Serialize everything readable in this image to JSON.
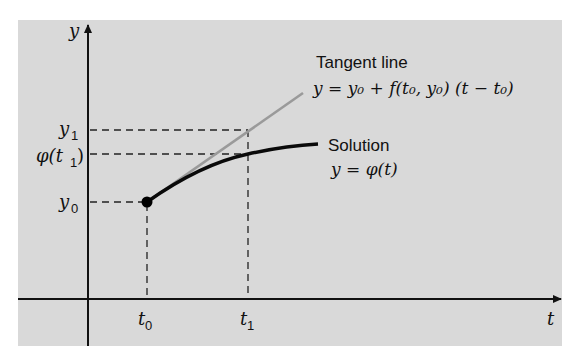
{
  "figure": {
    "type": "euler-method-diagram",
    "axes": {
      "x_label": "t",
      "y_label": "y"
    },
    "ticks": {
      "x": [
        {
          "base": "t",
          "sub": "0"
        },
        {
          "base": "t",
          "sub": "1"
        }
      ],
      "y": [
        {
          "base": "y",
          "sub": "0"
        },
        {
          "base": "y",
          "sub": "1"
        },
        {
          "base": "φ(t",
          "sub": "1",
          "tail": ")"
        }
      ]
    },
    "annotations": {
      "tangent_title": "Tangent line",
      "tangent_equation": "y = y₀ + f(t₀, y₀) (t − t₀)",
      "solution_title": "Solution",
      "solution_equation": "y = φ(t)"
    },
    "colors": {
      "background": "#d9d9d9",
      "axes": "#111111",
      "solution_curve": "#0a0a0a",
      "tangent_line": "#9a9a9a",
      "dashed_guides": "#222222"
    }
  }
}
